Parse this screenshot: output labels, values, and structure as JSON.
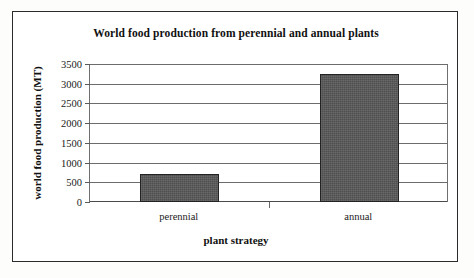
{
  "chart_data": {
    "type": "bar",
    "title": "World food production from perennial and annual plants",
    "xlabel": "plant strategy",
    "ylabel": "world food production (MT)",
    "categories": [
      "perennial",
      "annual"
    ],
    "values": [
      710,
      3250
    ],
    "ylim": [
      0,
      3500
    ],
    "yticks": [
      0,
      500,
      1000,
      1500,
      2000,
      2500,
      3000,
      3500
    ],
    "ytick_labels": [
      "0",
      "500",
      "1000",
      "1500",
      "2000",
      "2500",
      "3000",
      "3500"
    ],
    "grid": true,
    "legend": false,
    "bar_color": "#575757",
    "bar_edge_color": "#232323",
    "gridline_color": "#6c6c6c",
    "axis_color": "#4a4a4a",
    "frame_color": "#2b2b2b",
    "background": "#ffffff"
  }
}
